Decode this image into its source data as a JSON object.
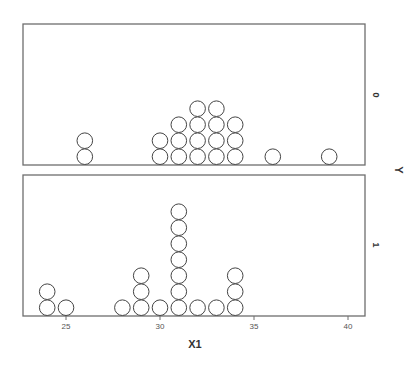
{
  "chart_data": {
    "type": "scatter",
    "subtype": "dot-plot (stacked, paneled by Y)",
    "xlabel": "X1",
    "ylabel": "Y",
    "xlim": [
      22,
      41
    ],
    "xticks": [
      25,
      30,
      35,
      40
    ],
    "grid": false,
    "panels": [
      {
        "label": "0",
        "points": [
          {
            "x": 26,
            "count": 2
          },
          {
            "x": 30,
            "count": 2
          },
          {
            "x": 31,
            "count": 3
          },
          {
            "x": 32,
            "count": 4
          },
          {
            "x": 33,
            "count": 4
          },
          {
            "x": 34,
            "count": 3
          },
          {
            "x": 36,
            "count": 1
          },
          {
            "x": 39,
            "count": 1
          }
        ]
      },
      {
        "label": "1",
        "points": [
          {
            "x": 24,
            "count": 2
          },
          {
            "x": 25,
            "count": 1
          },
          {
            "x": 28,
            "count": 1
          },
          {
            "x": 29,
            "count": 3
          },
          {
            "x": 30,
            "count": 1
          },
          {
            "x": 31,
            "count": 7
          },
          {
            "x": 32,
            "count": 1
          },
          {
            "x": 33,
            "count": 1
          },
          {
            "x": 34,
            "count": 3
          }
        ]
      }
    ]
  },
  "layout": {
    "frame_left": 23,
    "frame_right": 365,
    "panels_px": [
      {
        "top": 24,
        "bottom": 165,
        "label_y": 95
      },
      {
        "top": 175,
        "bottom": 316,
        "label_y": 245
      }
    ],
    "x_ref_value": 30,
    "x_ref_px": 160,
    "px_per_unit": 18.8,
    "dot_radius": 7.8,
    "dot_step": 16
  }
}
